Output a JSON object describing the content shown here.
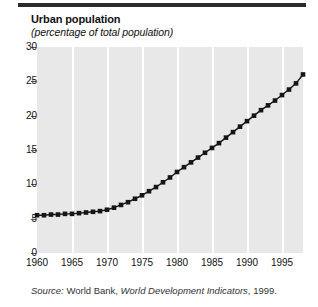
{
  "header": {
    "title": "Urban population",
    "subtitle": "(percentage of total population)"
  },
  "source": {
    "prefix": "Source:",
    "publisher": "World Bank,",
    "work": "World Development Indicators",
    "year": ", 1999."
  },
  "colors": {
    "plot_background": "#e8e8e8",
    "gridline": "#ffffff",
    "marker": "#161616",
    "line": "#161616",
    "rule": "#2b2b2b",
    "text": "#111111"
  },
  "chart_data": {
    "type": "line",
    "title": "Urban population",
    "subtitle": "(percentage of total population)",
    "xlabel": "",
    "ylabel": "",
    "xlim": [
      1960,
      1998
    ],
    "ylim": [
      0,
      30
    ],
    "yticks": [
      0,
      5,
      10,
      15,
      20,
      25,
      30
    ],
    "xticks": [
      1960,
      1965,
      1970,
      1975,
      1980,
      1985,
      1990,
      1995
    ],
    "grid": "vertical",
    "legend": "none",
    "marker": "square",
    "x": [
      1960,
      1961,
      1962,
      1963,
      1964,
      1965,
      1966,
      1967,
      1968,
      1969,
      1970,
      1971,
      1972,
      1973,
      1974,
      1975,
      1976,
      1977,
      1978,
      1979,
      1980,
      1981,
      1982,
      1983,
      1984,
      1985,
      1986,
      1987,
      1988,
      1989,
      1990,
      1991,
      1992,
      1993,
      1994,
      1995,
      1996,
      1997,
      1998
    ],
    "values": [
      5.5,
      5.5,
      5.6,
      5.6,
      5.7,
      5.7,
      5.8,
      5.9,
      6.0,
      6.1,
      6.3,
      6.6,
      7.0,
      7.4,
      7.9,
      8.4,
      9.0,
      9.6,
      10.3,
      11.0,
      11.8,
      12.5,
      13.2,
      13.9,
      14.6,
      15.3,
      16.0,
      16.8,
      17.6,
      18.4,
      19.2,
      20.0,
      20.8,
      21.5,
      22.2,
      23.0,
      23.8,
      24.7,
      26.0
    ]
  }
}
